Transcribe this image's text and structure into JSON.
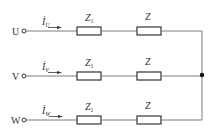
{
  "diagram": {
    "type": "three-phase circuit",
    "colors": {
      "wire": "#7a7a7a",
      "component": "#333333",
      "text": "#333333",
      "node": "#111111"
    },
    "phases": [
      {
        "terminal": "U",
        "current_symbol": "İ",
        "current_sub": "U",
        "z1_label": "Z",
        "z1_sub": "1",
        "z_label": "Z",
        "y": 31
      },
      {
        "terminal": "V",
        "current_symbol": "İ",
        "current_sub": "V",
        "z1_label": "Z",
        "z1_sub": "1",
        "z_label": "Z",
        "y": 76
      },
      {
        "terminal": "W",
        "current_symbol": "İ",
        "current_sub": "W",
        "z1_label": "Z",
        "z1_sub": "1",
        "z_label": "Z",
        "y": 120
      }
    ],
    "junction_node": "neutral star point"
  }
}
